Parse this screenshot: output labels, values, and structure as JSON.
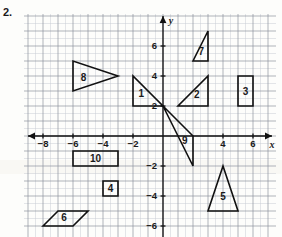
{
  "problem": {
    "number": "2."
  },
  "graph": {
    "origin_px": {
      "x": 163,
      "y": 136
    },
    "unit_px": 15,
    "x_range": [
      -9,
      7
    ],
    "y_range": [
      -6,
      8
    ],
    "grid": "on",
    "axis_labels": {
      "x": "x",
      "y": "y"
    },
    "x_ticks": [
      {
        "value": -8,
        "label": "−8"
      },
      {
        "value": -6,
        "label": "−6"
      },
      {
        "value": -4,
        "label": "−4"
      },
      {
        "value": -2,
        "label": "−2"
      },
      {
        "value": 4,
        "label": "4"
      },
      {
        "value": 6,
        "label": "6"
      }
    ],
    "y_ticks": [
      {
        "value": 6,
        "label": "6"
      },
      {
        "value": 4,
        "label": "4"
      },
      {
        "value": 2,
        "label": "2"
      },
      {
        "value": -2,
        "label": "−2"
      },
      {
        "value": -4,
        "label": "−4"
      },
      {
        "value": -6,
        "label": "−6"
      }
    ],
    "shapes": [
      {
        "label": "1",
        "type": "triangle",
        "points": [
          [
            -2,
            4
          ],
          [
            -2,
            2
          ],
          [
            0,
            2
          ]
        ],
        "label_at": [
          -1.45,
          2.6
        ]
      },
      {
        "label": "2",
        "type": "triangle",
        "points": [
          [
            1,
            2
          ],
          [
            3,
            2
          ],
          [
            3,
            4
          ]
        ],
        "label_at": [
          2.25,
          2.55
        ]
      },
      {
        "label": "3",
        "type": "rectangle",
        "points": [
          [
            5,
            4
          ],
          [
            6,
            4
          ],
          [
            6,
            2
          ],
          [
            5,
            2
          ]
        ],
        "label_at": [
          5.5,
          2.75
        ]
      },
      {
        "label": "4",
        "type": "square",
        "points": [
          [
            -4,
            -3
          ],
          [
            -3,
            -3
          ],
          [
            -3,
            -4
          ],
          [
            -4,
            -4
          ]
        ],
        "label_at": [
          -3.5,
          -3.75
        ]
      },
      {
        "label": "5",
        "type": "triangle",
        "points": [
          [
            3,
            -5
          ],
          [
            5,
            -5
          ],
          [
            4,
            -2
          ]
        ],
        "label_at": [
          4.0,
          -4.25
        ]
      },
      {
        "label": "6",
        "type": "parallelogram",
        "points": [
          [
            -8,
            -6
          ],
          [
            -7,
            -5
          ],
          [
            -5,
            -5
          ],
          [
            -6,
            -6
          ]
        ],
        "label_at": [
          -6.6,
          -5.65
        ]
      },
      {
        "label": "7",
        "type": "triangle",
        "points": [
          [
            2,
            5
          ],
          [
            3,
            5
          ],
          [
            3,
            7
          ]
        ],
        "label_at": [
          2.55,
          5.4
        ]
      },
      {
        "label": "8",
        "type": "triangle",
        "points": [
          [
            -6,
            5
          ],
          [
            -6,
            3
          ],
          [
            -3,
            4
          ]
        ],
        "label_at": [
          -5.3,
          3.7
        ]
      },
      {
        "label": "9",
        "type": "triangle",
        "points": [
          [
            0,
            2
          ],
          [
            2,
            0
          ],
          [
            2,
            -2
          ]
        ],
        "label_at": [
          1.45,
          -0.5
        ]
      },
      {
        "label": "10",
        "type": "rectangle",
        "points": [
          [
            -6,
            -1
          ],
          [
            -3,
            -1
          ],
          [
            -3,
            -2
          ],
          [
            -6,
            -2
          ]
        ],
        "label_at": [
          -4.5,
          -1.75
        ]
      }
    ]
  }
}
